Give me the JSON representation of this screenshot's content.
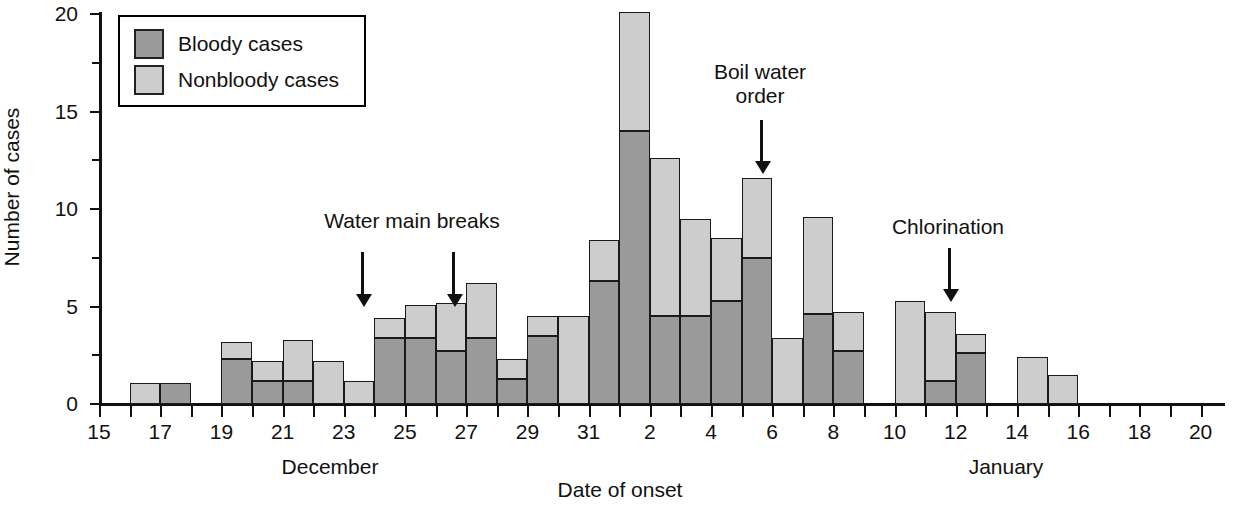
{
  "chart_data": {
    "type": "bar",
    "title": "",
    "xlabel": "Date of onset",
    "ylabel": "Number of cases",
    "ylim": [
      0,
      20
    ],
    "yticks": [
      0,
      5,
      10,
      15,
      20
    ],
    "yticks_minor": [
      2.5,
      7.5,
      12.5,
      17.5
    ],
    "grid": false,
    "stacked": true,
    "legend_position": "top-left",
    "legend": [
      "Bloody cases",
      "Nonbloody cases"
    ],
    "month_labels": [
      "December",
      "January"
    ],
    "categories": [
      "Dec 15",
      "Dec 16",
      "Dec 17",
      "Dec 18",
      "Dec 19",
      "Dec 20",
      "Dec 21",
      "Dec 22",
      "Dec 23",
      "Dec 24",
      "Dec 25",
      "Dec 26",
      "Dec 27",
      "Dec 28",
      "Dec 29",
      "Dec 30",
      "Dec 31",
      "Jan 1",
      "Jan 2",
      "Jan 3",
      "Jan 4",
      "Jan 5",
      "Jan 6",
      "Jan 7",
      "Jan 8",
      "Jan 9",
      "Jan 10",
      "Jan 11",
      "Jan 12",
      "Jan 13",
      "Jan 14",
      "Jan 15",
      "Jan 16",
      "Jan 17",
      "Jan 18",
      "Jan 19",
      "Jan 20"
    ],
    "tick_labels": [
      "15",
      "",
      "17",
      "",
      "19",
      "",
      "21",
      "",
      "23",
      "",
      "25",
      "",
      "27",
      "",
      "29",
      "",
      "31",
      "",
      "2",
      "",
      "4",
      "",
      "6",
      "",
      "8",
      "",
      "10",
      "",
      "12",
      "",
      "14",
      "",
      "16",
      "",
      "18",
      "",
      "20"
    ],
    "series": [
      {
        "name": "Bloody cases",
        "color": "#9a9a9a",
        "values": [
          0,
          0,
          1.1,
          0,
          2.3,
          1.2,
          1.2,
          0,
          0,
          3.4,
          3.4,
          2.7,
          3.4,
          1.3,
          3.5,
          0,
          6.3,
          14.0,
          4.5,
          4.5,
          5.3,
          7.5,
          0,
          4.6,
          2.7,
          0,
          0,
          1.2,
          2.6,
          0,
          0,
          0,
          0,
          0,
          0,
          0,
          0
        ]
      },
      {
        "name": "Nonbloody cases",
        "color": "#cdcdcd",
        "values": [
          0,
          1.1,
          0,
          0,
          0.9,
          1.0,
          2.1,
          2.2,
          1.2,
          1.0,
          1.7,
          2.5,
          2.8,
          1.0,
          1.0,
          4.5,
          2.1,
          6.1,
          8.1,
          5.0,
          3.2,
          4.1,
          3.4,
          5.0,
          2.0,
          0,
          5.3,
          3.5,
          1.0,
          0,
          2.4,
          1.5,
          0,
          0,
          0,
          0,
          0
        ]
      }
    ],
    "totals": [
      0,
      1.1,
      1.1,
      0,
      3.2,
      2.2,
      3.3,
      2.2,
      1.2,
      4.4,
      5.1,
      5.2,
      6.2,
      2.3,
      4.5,
      4.5,
      8.4,
      20.1,
      12.6,
      9.5,
      8.5,
      11.6,
      3.4,
      9.6,
      4.7,
      0,
      5.3,
      4.7,
      3.6,
      0,
      2.4,
      1.5,
      0,
      0,
      0,
      0,
      0
    ],
    "annotations": [
      {
        "label": "Water main breaks",
        "text_x": 412,
        "text_y": 209,
        "arrows_x": [
          361,
          452
        ],
        "arrow_top": 252,
        "arrow_bottom": 305
      },
      {
        "label": "Boil water\norder",
        "label_line1": "Boil water",
        "label_line2": "order",
        "text_x": 765,
        "text_y": 60,
        "arrows_x": [
          760
        ],
        "arrow_top": 120,
        "arrow_bottom": 172
      },
      {
        "label": "Chlorination",
        "text_x": 948,
        "text_y": 215,
        "arrows_x": [
          948
        ],
        "arrow_top": 248,
        "arrow_bottom": 300
      }
    ]
  }
}
